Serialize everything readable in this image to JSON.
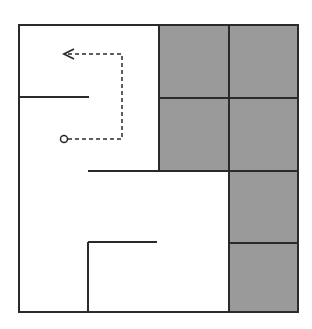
{
  "diagram": {
    "type": "maze-grid",
    "colors": {
      "background": "#ffffff",
      "wall": "#2a2a2a",
      "blocked_cell": "#9a9a9a",
      "path": "#2a2a2a"
    },
    "outer_box": {
      "x1": 19,
      "y1": 25,
      "x2": 298,
      "y2": 312
    },
    "blocked_cells": [
      {
        "x": 159,
        "y": 25,
        "w": 70,
        "h": 73
      },
      {
        "x": 229,
        "y": 25,
        "w": 69,
        "h": 73
      },
      {
        "x": 159,
        "y": 98,
        "w": 70,
        "h": 73
      },
      {
        "x": 229,
        "y": 98,
        "w": 69,
        "h": 73
      },
      {
        "x": 229,
        "y": 171,
        "w": 69,
        "h": 72
      },
      {
        "x": 229,
        "y": 243,
        "w": 69,
        "h": 69
      }
    ],
    "walls": [
      {
        "x1": 19,
        "y1": 97,
        "x2": 89,
        "y2": 97
      },
      {
        "x1": 88,
        "y1": 171,
        "x2": 298,
        "y2": 171
      },
      {
        "x1": 88,
        "y1": 242,
        "x2": 157,
        "y2": 242
      },
      {
        "x1": 88,
        "y1": 242,
        "x2": 88,
        "y2": 312
      }
    ],
    "path": {
      "start": {
        "x": 64,
        "y": 139
      },
      "points": [
        [
          68,
          139
        ],
        [
          122,
          139
        ],
        [
          122,
          54
        ],
        [
          64,
          54
        ]
      ],
      "end_arrow": "left"
    }
  }
}
